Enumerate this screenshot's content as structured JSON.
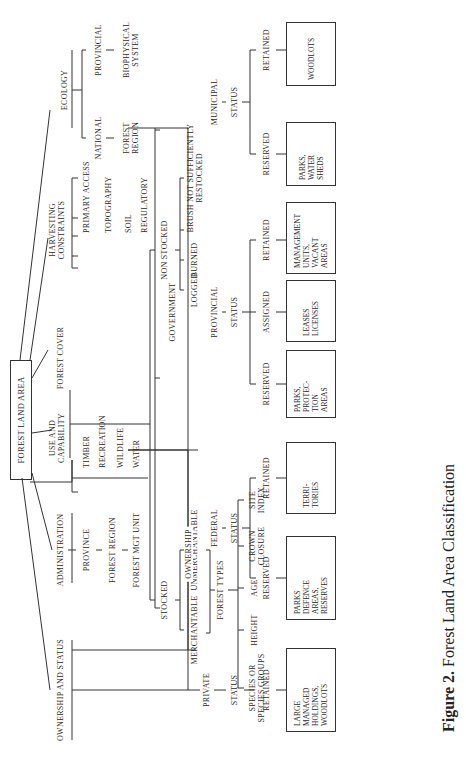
{
  "root": "FOREST LAND AREA",
  "categories": {
    "ownership_status": "OWNERSHIP AND STATUS",
    "administration": "ADMINISTRATION",
    "use_capability": [
      "USE AND",
      "CAPABILITY"
    ],
    "forest_cover": "FOREST COVER",
    "harvesting": [
      "HARVESTING",
      "CONSTRAINTS"
    ],
    "ecology": "ECOLOGY"
  },
  "administration_items": [
    "PROVINCE",
    "FOREST REGION",
    "FOREST MGT UNIT"
  ],
  "use_items": [
    "TIMBER",
    "RECREATION",
    "WILDLIFE",
    "WATER"
  ],
  "harvesting_items": [
    "PRIMARY ACCESS",
    "TOPOGRAPHY",
    "SOIL",
    "REGULATORY"
  ],
  "ecology_items": {
    "national": "NATIONAL",
    "national_sub": [
      "FOREST",
      "REGION"
    ],
    "provincial": "PROVINCIAL",
    "provincial_sub": [
      "BIOPHYSICAL",
      "SYSTEM"
    ]
  },
  "forest_cover": {
    "stocked": "STOCKED",
    "non_stocked": "NON STOCKED",
    "merchantable": "MERCHANTABLE",
    "unmerchantable": "UNMERCHANTABLE",
    "forest_types": "FOREST TYPES",
    "types": [
      [
        "SPECIES OR",
        "SPECIES GROUPS"
      ],
      [
        "HEIGHT"
      ],
      [
        "AGE"
      ],
      [
        "CROWN",
        "CLOSURE"
      ],
      [
        "SITE",
        "INDEX"
      ]
    ],
    "non_stocked_items": [
      "LOGGED",
      "BURNED"
    ],
    "brush": [
      "BRUSH  NOT  SUFFICIENTLY",
      "RESTOCKED"
    ]
  },
  "ownership": {
    "label": "OWNERSHIP",
    "private": "PRIVATE",
    "government": "GOVERNMENT",
    "federal": "FEDERAL",
    "provincial": "PROVINCIAL",
    "municipal": "MUNICIPAL",
    "status": "STATUS",
    "retained": "RETAINED",
    "reserved": "RESERVED",
    "assigned": "ASSIGNED",
    "boxes": {
      "private_retained": [
        "LARGE",
        "MANAGED",
        "HOLDINGS,",
        "WOODLOTS"
      ],
      "federal_reserved": [
        "PARKS",
        "DEFENCE",
        "AREAS,",
        "RESERVES"
      ],
      "federal_retained": [
        "TERRI-",
        "TORIES"
      ],
      "provincial_reserved": [
        "PARKS,",
        "PROTEC-",
        "TION",
        "AREAS"
      ],
      "provincial_assigned": [
        "LEASES",
        "LICENSES"
      ],
      "provincial_retained": [
        "MANAGEMENT",
        "UNITS,",
        "VACANT",
        "AREAS"
      ],
      "municipal_reserved": [
        "PARKS,",
        "WATER",
        "SHEDS"
      ],
      "municipal_retained": [
        "WOODLOTS"
      ]
    }
  },
  "caption": {
    "figure": "Figure 2.",
    "title": "Forest Land Area Classification"
  }
}
